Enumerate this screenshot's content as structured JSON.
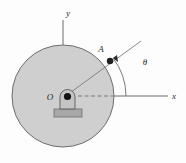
{
  "figure": {
    "background_color": "#fdfdfd",
    "labels": {
      "y_axis": "y",
      "x_axis": "x",
      "point_a": "A",
      "center_o": "O",
      "angle_theta": "θ"
    },
    "colors": {
      "disc_fill": "#cfcfcf",
      "disc_stroke": "#6e6e6e",
      "hub_fill": "#c4c4c4",
      "hub_stroke": "#5a5a5a",
      "pin_fill": "#1a1a1a",
      "base_fill": "#a8a8a8",
      "base_stroke": "#6e6e6e",
      "axis_stroke": "#6b6b6b",
      "line_stroke": "#7a7a7a",
      "text_color": "#2b2b2b"
    },
    "geometry": {
      "disc_center_x": 63,
      "disc_center_y": 96,
      "disc_radius": 51,
      "point_a_x": 110,
      "point_a_y": 61,
      "arc_radius": 62,
      "theta_degrees": 37
    }
  }
}
